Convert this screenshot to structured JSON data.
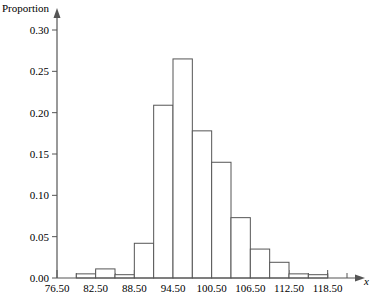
{
  "chart_data": {
    "type": "bar",
    "title": "",
    "subtitle": "",
    "xlabel": "x",
    "ylabel": "Proportion",
    "grid": false,
    "legend": null,
    "bin_width": 3,
    "bin_starts": [
      76.5,
      79.5,
      82.5,
      85.5,
      88.5,
      91.5,
      94.5,
      97.5,
      100.5,
      103.5,
      106.5,
      109.5,
      112.5,
      115.5,
      118.5
    ],
    "categories": [
      "76.50-79.50",
      "79.50-82.50",
      "82.50-85.50",
      "85.50-88.50",
      "88.50-91.50",
      "91.50-94.50",
      "94.50-97.50",
      "97.50-100.50",
      "100.50-103.50",
      "103.50-106.50",
      "106.50-109.50",
      "109.50-112.50",
      "112.50-115.50",
      "115.50-118.50"
    ],
    "values": [
      0.0,
      0.005,
      0.011,
      0.004,
      0.042,
      0.209,
      0.265,
      0.178,
      0.14,
      0.073,
      0.035,
      0.019,
      0.005,
      0.004
    ],
    "xlim": [
      76.5,
      121.5
    ],
    "ylim": [
      0.0,
      0.315
    ],
    "x_tick_labels": [
      "76.50",
      "82.50",
      "88.50",
      "94.50",
      "100.50",
      "106.50",
      "112.50",
      "118.50"
    ],
    "x_tick_values": [
      76.5,
      82.5,
      88.5,
      94.5,
      100.5,
      106.5,
      112.5,
      118.5
    ],
    "x_minor_tick_values": [
      79.5,
      85.5,
      91.5,
      97.5,
      103.5,
      109.5,
      115.5,
      118.5,
      121.5
    ],
    "y_tick_labels": [
      "0.00",
      "0.05",
      "0.10",
      "0.15",
      "0.20",
      "0.25",
      "0.30"
    ],
    "y_tick_values": [
      0.0,
      0.05,
      0.1,
      0.15,
      0.2,
      0.25,
      0.3
    ],
    "bar_fill": "#ffffff",
    "bar_stroke": "#555555",
    "axis_color": "#555555"
  }
}
